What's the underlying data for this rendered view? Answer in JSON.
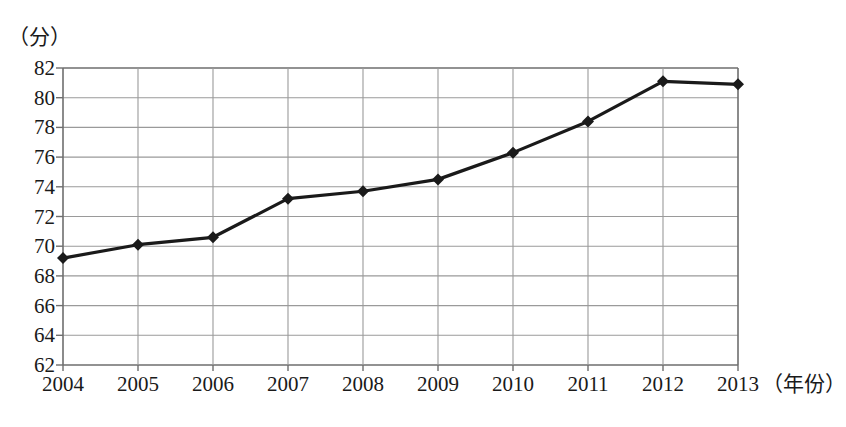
{
  "chart_data": {
    "type": "line",
    "title": "",
    "xlabel": "（年份）",
    "ylabel": "（分）",
    "x": [
      "2004",
      "2005",
      "2006",
      "2007",
      "2008",
      "2009",
      "2010",
      "2011",
      "2012",
      "2013"
    ],
    "categories": [
      "2004",
      "2005",
      "2006",
      "2007",
      "2008",
      "2009",
      "2010",
      "2011",
      "2012",
      "2013"
    ],
    "values": [
      69.2,
      70.1,
      70.6,
      73.2,
      73.7,
      74.5,
      76.3,
      78.4,
      81.1,
      80.9
    ],
    "series": [
      {
        "name": "",
        "values": [
          69.2,
          70.1,
          70.6,
          73.2,
          73.7,
          74.5,
          76.3,
          78.4,
          81.1,
          80.9
        ]
      }
    ],
    "ylim": [
      62,
      82
    ],
    "yticks": [
      62,
      64,
      66,
      68,
      70,
      72,
      74,
      76,
      78,
      80,
      82
    ],
    "ytick_labels": [
      "62",
      "64",
      "66",
      "68",
      "70",
      "72",
      "74",
      "76",
      "78",
      "80",
      "82"
    ],
    "xtick_labels": [
      "2004",
      "2005",
      "2006",
      "2007",
      "2008",
      "2009",
      "2010",
      "2011",
      "2012",
      "2013"
    ],
    "grid": true,
    "legend": "none",
    "marker": "diamond",
    "line_color": "#1a1a1a",
    "grid_color": "#9a9a9a",
    "axis_color": "#6e6e6e",
    "background_color": "#ffffff"
  }
}
